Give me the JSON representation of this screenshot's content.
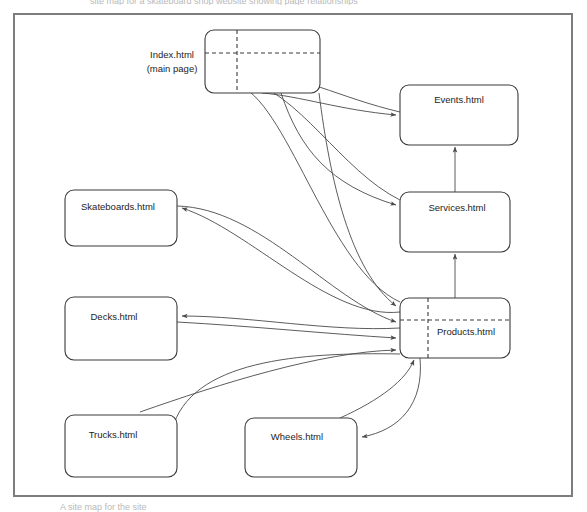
{
  "diagram": {
    "type": "site-map-flow-diagram",
    "title_fragment_top": "site map for a skateboard shop website showing page relationships",
    "caption_fragment_bottom": "A site map for the site",
    "frame": {
      "color": "#7d7d7d"
    },
    "stroke_color": "#4a4a4a",
    "box_stroke_color": "#3a3a3a",
    "nodes": [
      {
        "id": "index",
        "label": "Index.html",
        "sublabel": "(main page)",
        "label_position": "outside-left",
        "x": 205,
        "y": 30,
        "w": 115,
        "h": 63,
        "has_dashed_grid": true
      },
      {
        "id": "events",
        "label": "Events.html",
        "sublabel": "",
        "label_position": "inside",
        "x": 400,
        "y": 85,
        "w": 118,
        "h": 60,
        "has_dashed_grid": false
      },
      {
        "id": "services",
        "label": "Services.html",
        "sublabel": "",
        "label_position": "inside",
        "x": 400,
        "y": 192,
        "w": 110,
        "h": 60,
        "has_dashed_grid": false
      },
      {
        "id": "products",
        "label": "Products.html",
        "sublabel": "",
        "label_position": "inside",
        "x": 400,
        "y": 298,
        "w": 110,
        "h": 60,
        "has_dashed_grid": true
      },
      {
        "id": "skateboards",
        "label": "Skateboards.html",
        "sublabel": "",
        "label_position": "inside",
        "x": 65,
        "y": 190,
        "w": 112,
        "h": 56,
        "has_dashed_grid": false
      },
      {
        "id": "decks",
        "label": "Decks.html",
        "sublabel": "",
        "label_position": "inside",
        "x": 65,
        "y": 297,
        "w": 112,
        "h": 63,
        "has_dashed_grid": false
      },
      {
        "id": "trucks",
        "label": "Trucks.html",
        "sublabel": "",
        "label_position": "inside",
        "x": 65,
        "y": 415,
        "w": 112,
        "h": 62,
        "has_dashed_grid": false
      },
      {
        "id": "wheels",
        "label": "Wheels.html",
        "sublabel": "",
        "label_position": "inside",
        "x": 245,
        "y": 418,
        "w": 112,
        "h": 59,
        "has_dashed_grid": false
      }
    ],
    "edges": [
      {
        "from": "index",
        "to": "events",
        "style": "curve",
        "arrow": "end"
      },
      {
        "from": "index",
        "to": "services",
        "style": "curve",
        "arrow": "end"
      },
      {
        "from": "index",
        "to": "products",
        "style": "curve",
        "arrow": "end"
      },
      {
        "from": "events",
        "to": "index",
        "style": "curve",
        "arrow": "end"
      },
      {
        "from": "services",
        "to": "index",
        "style": "curve",
        "arrow": "end"
      },
      {
        "from": "products",
        "to": "index",
        "style": "curve",
        "arrow": "end"
      },
      {
        "from": "services",
        "to": "events",
        "style": "straight-vertical",
        "arrow": "both"
      },
      {
        "from": "products",
        "to": "services",
        "style": "straight-vertical",
        "arrow": "both"
      },
      {
        "from": "products",
        "to": "skateboards",
        "style": "curve",
        "arrow": "end"
      },
      {
        "from": "skateboards",
        "to": "products",
        "style": "curve",
        "arrow": "end"
      },
      {
        "from": "products",
        "to": "decks",
        "style": "curve",
        "arrow": "end"
      },
      {
        "from": "decks",
        "to": "products",
        "style": "curve",
        "arrow": "end"
      },
      {
        "from": "products",
        "to": "trucks",
        "style": "curve",
        "arrow": "end"
      },
      {
        "from": "trucks",
        "to": "products",
        "style": "curve",
        "arrow": "end"
      },
      {
        "from": "products",
        "to": "wheels",
        "style": "curve",
        "arrow": "end"
      },
      {
        "from": "wheels",
        "to": "products",
        "style": "curve",
        "arrow": "end"
      }
    ]
  }
}
